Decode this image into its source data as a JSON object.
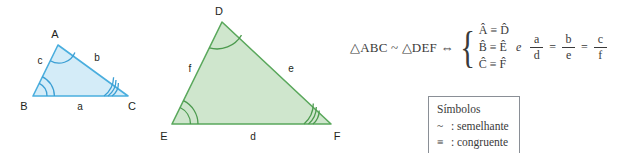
{
  "figure": {
    "background_color": "#ffffff"
  },
  "triangle_abc": {
    "name": "Triângulo ABC",
    "fill_color": "#d4ecf8",
    "stroke_color": "#4aaede",
    "arc_color": "#3c9fd4",
    "vertices": [
      {
        "label": "A",
        "x": 58,
        "y": 45,
        "label_x": 55,
        "label_y": 38,
        "arcs": 1
      },
      {
        "label": "B",
        "x": 33,
        "y": 96,
        "label_x": 24,
        "label_y": 108,
        "arcs": 2
      },
      {
        "label": "C",
        "x": 128,
        "y": 96,
        "label_x": 130,
        "label_y": 108,
        "arcs": 3
      }
    ],
    "sides": [
      {
        "label": "a",
        "x": 80,
        "y": 109,
        "between": "BC"
      },
      {
        "label": "b",
        "x": 97,
        "y": 59,
        "between": "AC"
      },
      {
        "label": "c",
        "x": 41,
        "y": 63,
        "between": "AB"
      }
    ]
  },
  "triangle_def": {
    "name": "Triângulo DEF",
    "fill_color": "#cfe6cd",
    "stroke_color": "#5aa85c",
    "arc_color": "#4c9a4e",
    "vertices": [
      {
        "label": "D",
        "x": 222,
        "y": 22,
        "label_x": 219,
        "label_y": 15,
        "arcs": 1
      },
      {
        "label": "E",
        "x": 172,
        "y": 124,
        "label_x": 163,
        "label_y": 138,
        "arcs": 2
      },
      {
        "label": "F",
        "x": 331,
        "y": 124,
        "label_x": 333,
        "label_y": 138,
        "arcs": 3
      }
    ],
    "sides": [
      {
        "label": "d",
        "x": 253,
        "y": 138,
        "between": "EF"
      },
      {
        "label": "e",
        "x": 291,
        "y": 70,
        "between": "DF"
      },
      {
        "label": "f",
        "x": 190,
        "y": 70,
        "between": "DE"
      }
    ]
  },
  "formula": {
    "statement": "△ABC ~ △DEF ⇔",
    "angle_equalities": [
      {
        "left": "Â",
        "relation": "≡",
        "right": "D̂"
      },
      {
        "left": "B̂",
        "relation": "≡",
        "right": "Ê"
      },
      {
        "left": "Ĉ",
        "relation": "≡",
        "right": "F̂"
      }
    ],
    "conjunction": "e",
    "ratios": [
      {
        "numerator": "a",
        "denominator": "d"
      },
      {
        "numerator": "b",
        "denominator": "e"
      },
      {
        "numerator": "c",
        "denominator": "f"
      }
    ],
    "ratio_operator": "="
  },
  "legend": {
    "title": "Símbolos",
    "entries": [
      {
        "symbol": "~",
        "separator": ":",
        "meaning": "semelhante"
      },
      {
        "symbol": "≡",
        "separator": ":",
        "meaning": "congruente"
      }
    ],
    "border_color": "#8a8f96"
  }
}
